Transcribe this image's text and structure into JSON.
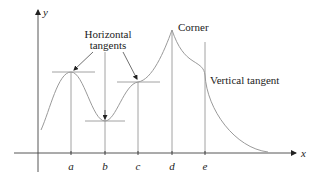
{
  "figure": {
    "type": "function-graph",
    "axes": {
      "x_label": "x",
      "y_label": "y",
      "ticks": [
        {
          "label": "a",
          "x": 71
        },
        {
          "label": "b",
          "x": 105
        },
        {
          "label": "c",
          "x": 138
        },
        {
          "label": "d",
          "x": 172
        },
        {
          "label": "e",
          "x": 205
        }
      ]
    },
    "annotations": {
      "horizontal_tangents_line1": "Horizontal",
      "horizontal_tangents_line2": "tangents",
      "corner": "Corner",
      "vertical_tangent": "Vertical tangent"
    },
    "features": [
      {
        "at": "a",
        "kind": "horizontal tangent (local max)"
      },
      {
        "at": "b",
        "kind": "horizontal tangent (local min)"
      },
      {
        "at": "c",
        "kind": "horizontal tangent (inflection)"
      },
      {
        "at": "d",
        "kind": "corner"
      },
      {
        "at": "e",
        "kind": "vertical tangent"
      }
    ],
    "colors": {
      "curve": "#9a9a9a",
      "axes": "#333333",
      "guides": "#8a8a8a",
      "text": "#222222"
    }
  }
}
